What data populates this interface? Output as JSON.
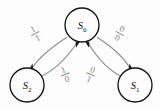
{
  "diagram": {
    "kind": "state-transition-diagram",
    "background_color": "#fdfdfd",
    "node_stroke_color": "#151515",
    "edge_stroke_color": "#8d8d8d",
    "label_color": "#7e7e7e",
    "nodes": [
      {
        "id": "S0",
        "name": "state-node-s0",
        "base": "S",
        "subscript": "0",
        "cx": 82,
        "cy": 25,
        "r": 17
      },
      {
        "id": "S2",
        "name": "state-node-s2",
        "base": "S",
        "subscript": "2",
        "cx": 27,
        "cy": 85,
        "r": 17
      },
      {
        "id": "S1",
        "name": "state-node-s1",
        "base": "S",
        "subscript": "1",
        "cx": 135,
        "cy": 85,
        "r": 17
      }
    ],
    "edges": [
      {
        "name": "edge-s0-to-s2",
        "from": "S0",
        "to": "S2",
        "input": "1",
        "output": "1",
        "label": "1/1",
        "label_x": 35,
        "label_y": 33
      },
      {
        "name": "edge-s0-to-s1",
        "from": "S0",
        "to": "S1",
        "input": "0",
        "output": "0",
        "label": "0/0",
        "label_x": 120,
        "label_y": 33
      },
      {
        "name": "edge-s2-to-s0",
        "from": "S2",
        "to": "S0",
        "input": "1",
        "output": "0",
        "label": "1/0",
        "label_x": 65,
        "label_y": 74
      },
      {
        "name": "edge-s1-to-s0",
        "from": "S1",
        "to": "S0",
        "input": "0",
        "output": "1",
        "label": "0/1",
        "label_x": 91,
        "label_y": 74
      }
    ]
  }
}
